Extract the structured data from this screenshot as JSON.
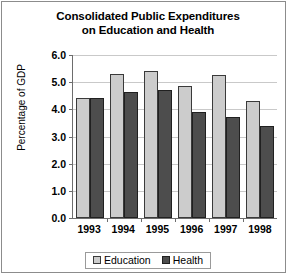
{
  "chart_data": {
    "type": "bar",
    "title": "Consolidated Public Expenditures on Education and Health",
    "title_line1": "Consolidated Public Expenditures",
    "title_line2": "on Education and Health",
    "xlabel": "",
    "ylabel": "Percentage of GDP",
    "categories": [
      "1993",
      "1994",
      "1995",
      "1996",
      "1997",
      "1998"
    ],
    "series": [
      {
        "name": "Education",
        "color": "#cccccc",
        "values": [
          4.4,
          5.3,
          5.4,
          4.85,
          5.25,
          4.3
        ]
      },
      {
        "name": "Health",
        "color": "#4d4d4d",
        "values": [
          4.4,
          4.65,
          4.7,
          3.9,
          3.7,
          3.4
        ]
      }
    ],
    "ylim": [
      0,
      6
    ],
    "ytick_labels": [
      "0.0",
      "1.0",
      "2.0",
      "3.0",
      "4.0",
      "5.0",
      "6.0"
    ],
    "ytick_values": [
      0,
      1,
      2,
      3,
      4,
      5,
      6
    ],
    "grid": true,
    "legend_position": "bottom"
  }
}
